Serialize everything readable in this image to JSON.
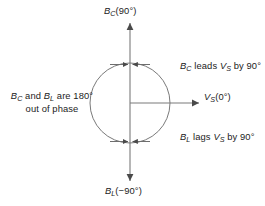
{
  "diagram": {
    "background_color": "#ffffff",
    "line_color": "#6e6e6e",
    "text_color": "#1c1c1c",
    "axes": {
      "vertical": {
        "label_top": "BC (90°)",
        "label_bottom": "BL (-90°)",
        "double_headed": true
      },
      "horizontal": {
        "label_right": "VS (0°)",
        "double_headed": false
      },
      "origin_x": 130,
      "origin_y": 103
    },
    "circle": {
      "center_x": 130,
      "center_y": 103,
      "radius": 40
    },
    "labels": {
      "bc_top": {
        "symbol": "B",
        "subscript": "C",
        "angle": "(90°)"
      },
      "bl_bottom": {
        "symbol": "B",
        "subscript": "L",
        "angle": "(−90°)"
      },
      "vs_right": {
        "symbol": "V",
        "subscript": "S",
        "angle": "(0°)"
      },
      "bc_leads": {
        "symbol": "B",
        "subscript": "C",
        "mid": " leads ",
        "symbol2": "V",
        "subscript2": "S",
        "tail": " by 90°"
      },
      "bl_lags": {
        "symbol": "B",
        "subscript": "L",
        "mid": " lags ",
        "symbol2": "V",
        "subscript2": "S",
        "tail": " by 90°"
      },
      "out_of_phase": {
        "symbol": "B",
        "subscript": "C",
        "mid": " and ",
        "symbol2": "B",
        "subscript2": "L",
        "tail": " are 180°",
        "line2": "out of phase"
      }
    },
    "arrow_pairs": {
      "top_y": 65,
      "bottom_y": 141,
      "description": "inward-pointing arrow pairs marking the circle intersections with the vertical axis"
    }
  }
}
